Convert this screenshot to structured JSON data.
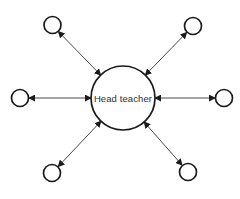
{
  "diagram": {
    "type": "star-network",
    "center_node": {
      "id": "center",
      "label": "Head teacher",
      "shape": "circle"
    },
    "satellite_nodes": [
      {
        "id": "top-left",
        "shape": "circle"
      },
      {
        "id": "top-right",
        "shape": "circle"
      },
      {
        "id": "left",
        "shape": "circle"
      },
      {
        "id": "right",
        "shape": "circle"
      },
      {
        "id": "bottom-left",
        "shape": "circle"
      },
      {
        "id": "bottom-right",
        "shape": "circle"
      }
    ],
    "connectors": [
      {
        "from": "center",
        "to": "top-left",
        "arrows": "both"
      },
      {
        "from": "center",
        "to": "top-right",
        "arrows": "both"
      },
      {
        "from": "center",
        "to": "left",
        "arrows": "both"
      },
      {
        "from": "center",
        "to": "right",
        "arrows": "both"
      },
      {
        "from": "center",
        "to": "bottom-left",
        "arrows": "both"
      },
      {
        "from": "center",
        "to": "bottom-right",
        "arrows": "both"
      }
    ],
    "colors": {
      "ink": "#1b1b1b",
      "line": "#4a4a4a",
      "text": "#2e2e2e",
      "background": "#ffffff"
    }
  }
}
